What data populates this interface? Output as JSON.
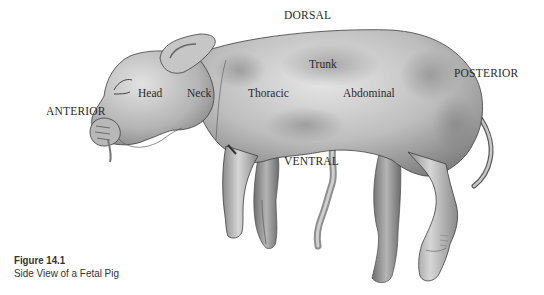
{
  "figure": {
    "number": "Figure 14.1",
    "title": "Side View of a Fetal Pig"
  },
  "directional_labels": {
    "dorsal": "DORSAL",
    "ventral": "VENTRAL",
    "anterior": "ANTERIOR",
    "posterior": "POSTERIOR"
  },
  "region_labels": {
    "head": "Head",
    "neck": "Neck",
    "thoracic": "Thoracic",
    "trunk": "Trunk",
    "abdominal": "Abdominal"
  },
  "colors": {
    "background": "#ffffff",
    "skin_light": "#d9d9d9",
    "skin_mid": "#a8a8a8",
    "skin_dark": "#6e6e6e",
    "outline": "#3a3a3a",
    "text": "#2a2a2a"
  }
}
